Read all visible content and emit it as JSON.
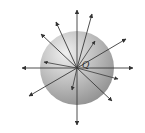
{
  "diagram": {
    "title": "",
    "charge_label": "Q",
    "sphere": {
      "cx": 77,
      "cy": 68,
      "r": 37
    },
    "field_lines": [
      {
        "x": 77,
        "y": 10,
        "behind": false
      },
      {
        "x": 77,
        "y": 125,
        "behind": false
      },
      {
        "x": 22,
        "y": 68,
        "behind": false
      },
      {
        "x": 133,
        "y": 68,
        "behind": false
      },
      {
        "x": 126,
        "y": 39,
        "behind": false
      },
      {
        "x": 41,
        "y": 34,
        "behind": false
      },
      {
        "x": 56,
        "y": 22,
        "behind": false
      },
      {
        "x": 92,
        "y": 14,
        "behind": false
      },
      {
        "x": 29,
        "y": 96,
        "behind": false
      },
      {
        "x": 112,
        "y": 101,
        "behind": false
      },
      {
        "x": 95,
        "y": 41,
        "behind": true
      },
      {
        "x": 44,
        "y": 62,
        "behind": true
      },
      {
        "x": 118,
        "y": 79,
        "behind": true
      },
      {
        "x": 72,
        "y": 90,
        "behind": true
      }
    ],
    "colors": {
      "line": "#3a3a3a",
      "sphere_light": "#e6e6e6",
      "sphere_dark": "#8c8c8c"
    }
  }
}
